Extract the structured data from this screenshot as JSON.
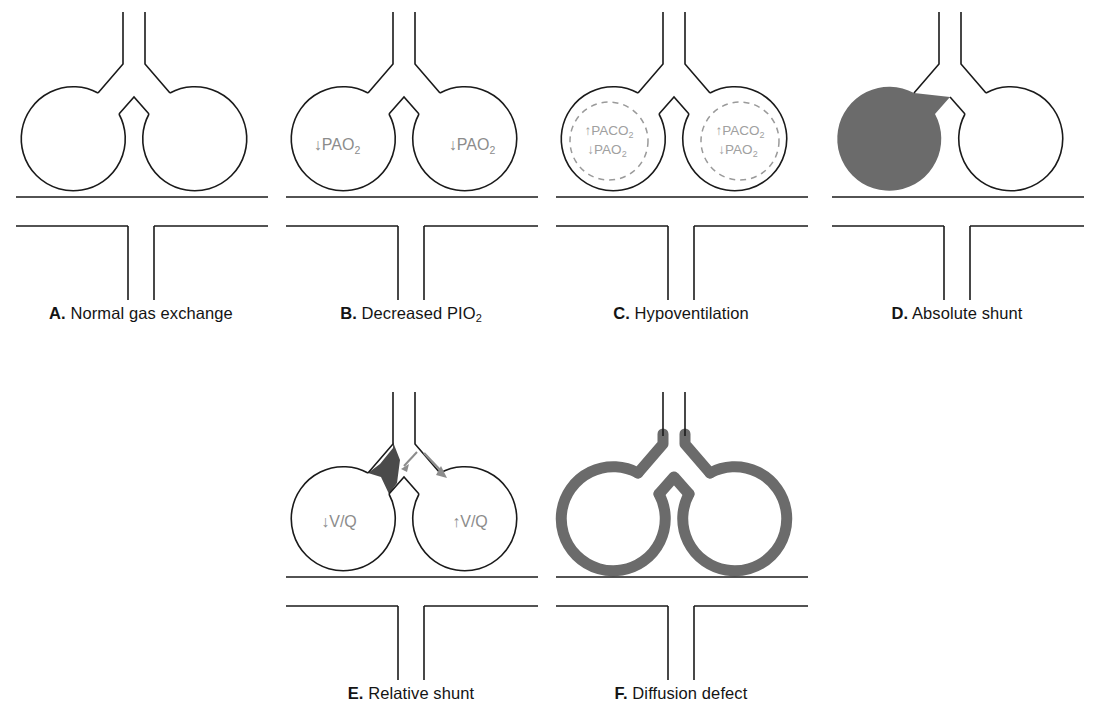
{
  "figure": {
    "background": "#ffffff",
    "stroke_black": "#1a1a1a",
    "gray_fill": "#6b6b6b",
    "gray_label": "#8c8c8c",
    "gray_dashed": "#9a9a9a"
  },
  "panels": [
    {
      "id": "A",
      "letter": "A.",
      "title": "Normal gas exchange",
      "alveoli": [
        {
          "side": "left",
          "fill": "none",
          "labels": []
        },
        {
          "side": "right",
          "fill": "none",
          "labels": []
        }
      ],
      "features": []
    },
    {
      "id": "B",
      "letter": "B.",
      "title": "Decreased PIO",
      "title_sub": "2",
      "alveoli": [
        {
          "side": "left",
          "fill": "none",
          "labels": [
            "↓PAO",
            "2"
          ]
        },
        {
          "side": "right",
          "fill": "none",
          "labels": [
            "↓PAO",
            "2"
          ]
        }
      ],
      "features": []
    },
    {
      "id": "C",
      "letter": "C.",
      "title": "Hypoventilation",
      "alveoli": [
        {
          "side": "left",
          "fill": "none",
          "labels": [
            "↑PACO",
            "2",
            "↓PAO",
            "2"
          ],
          "dashed_inner": true
        },
        {
          "side": "right",
          "fill": "none",
          "labels": [
            "↑PACO",
            "2",
            "↓PAO",
            "2"
          ],
          "dashed_inner": true
        }
      ],
      "features": [
        "dashed-inner-circle"
      ]
    },
    {
      "id": "D",
      "letter": "D.",
      "title": "Absolute shunt",
      "alveoli": [
        {
          "side": "left",
          "fill": "#6b6b6b",
          "labels": []
        },
        {
          "side": "right",
          "fill": "none",
          "labels": []
        }
      ],
      "features": [
        "filled-left-alveolus",
        "filled-left-bronchiole"
      ]
    },
    {
      "id": "E",
      "letter": "E.",
      "title": "Relative shunt",
      "alveoli": [
        {
          "side": "left",
          "fill": "none",
          "labels": [
            "↓V/Q"
          ]
        },
        {
          "side": "right",
          "fill": "none",
          "labels": [
            "↑V/Q"
          ]
        }
      ],
      "features": [
        "partial-obstruction",
        "flow-arrow-left",
        "flow-arrow-right"
      ]
    },
    {
      "id": "F",
      "letter": "F.",
      "title": "Diffusion defect",
      "alveoli": [
        {
          "side": "left",
          "fill": "none",
          "wall": "thick-gray",
          "labels": []
        },
        {
          "side": "right",
          "fill": "none",
          "wall": "thick-gray",
          "labels": []
        }
      ],
      "features": [
        "thickened-alveolar-walls"
      ]
    }
  ],
  "labels": {
    "pao2_down": "↓PAO",
    "paco2_up": "↑PACO",
    "vq_down": "↓V/Q",
    "vq_up": "↑V/Q",
    "subscript_two": "2"
  }
}
